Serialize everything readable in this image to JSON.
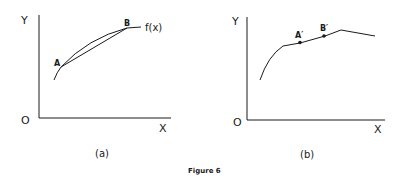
{
  "figure": {
    "caption": "Figure 6",
    "panels": [
      {
        "id": "a",
        "label": "(a)",
        "y_axis_label": "Y",
        "x_axis_label": "X",
        "origin_label": "O",
        "curve_label": "f(x)",
        "points": [
          "A",
          "B"
        ],
        "description": "Concave curve f(x) with chord connecting points A and B lying below the curve"
      },
      {
        "id": "b",
        "label": "(b)",
        "y_axis_label": "Y",
        "x_axis_label": "X",
        "origin_label": "O",
        "points": [
          "A′",
          "B′"
        ],
        "description": "Piecewise curve: concave rise, linear segment through A′ and B′, peak, then declining line"
      }
    ]
  },
  "colors": {
    "ink": "#1a1a1a",
    "background": "#ffffff"
  }
}
